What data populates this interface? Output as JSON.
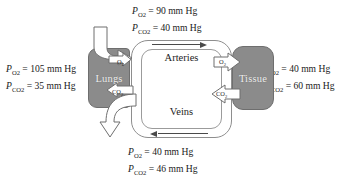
{
  "diagram": {
    "colors": {
      "organ_fill": "#8b8b8b",
      "organ_stroke": "#6e6e6e",
      "vessel_stroke": "#8e8e8e",
      "arrow_fill": "#ffffff",
      "arrow_stroke": "#6f6f6f",
      "text": "#1a1a1a"
    }
  },
  "labels": {
    "top": {
      "name": "arterial-blood-gases",
      "lines": [
        {
          "symbol": "P",
          "gas": "O",
          "gas_sub": "2",
          "value": "= 90 mm Hg"
        },
        {
          "symbol": "P",
          "gas": "CO",
          "gas_sub": "2",
          "value": "= 40 mm Hg"
        }
      ]
    },
    "bottom": {
      "name": "venous-blood-gases",
      "lines": [
        {
          "symbol": "P",
          "gas": "O",
          "gas_sub": "2",
          "value": "= 40 mm Hg"
        },
        {
          "symbol": "P",
          "gas": "CO",
          "gas_sub": "2",
          "value": "= 46 mm Hg"
        }
      ]
    },
    "left": {
      "name": "alveolar-gases",
      "lines": [
        {
          "symbol": "P",
          "gas": "O",
          "gas_sub": "2",
          "value": "= 105 mm Hg"
        },
        {
          "symbol": "P",
          "gas": "CO",
          "gas_sub": "2",
          "value": "= 35 mm Hg"
        }
      ]
    },
    "right": {
      "name": "tissue-gases",
      "lines": [
        {
          "symbol": "P",
          "gas": "O",
          "gas_sub": "2",
          "value": "= 40 mm Hg"
        },
        {
          "symbol": "P",
          "gas": "CO",
          "gas_sub": "2",
          "value": "= 60 mm Hg"
        }
      ]
    }
  },
  "organs": {
    "lungs": {
      "label": "Lungs"
    },
    "tissue": {
      "label": "Tissue"
    }
  },
  "vessels": {
    "arteries": {
      "label": "Arteries",
      "flow_direction": "right"
    },
    "veins": {
      "label": "Veins",
      "flow_direction": "left"
    }
  },
  "gas_arrows": {
    "o2_lungs_to_blood": {
      "gas": "O",
      "gas_sub": "2",
      "direction": "right"
    },
    "co2_blood_to_lungs": {
      "gas": "CO",
      "gas_sub": "2",
      "direction": "left"
    },
    "o2_blood_to_tissue": {
      "gas": "O",
      "gas_sub": "2",
      "direction": "right"
    },
    "co2_tissue_to_blood": {
      "gas": "CO",
      "gas_sub": "2",
      "direction": "left"
    },
    "inhaled_air": {
      "label": "",
      "direction": "down-right"
    },
    "exhaled_air": {
      "label": "",
      "direction": "down-left"
    }
  }
}
